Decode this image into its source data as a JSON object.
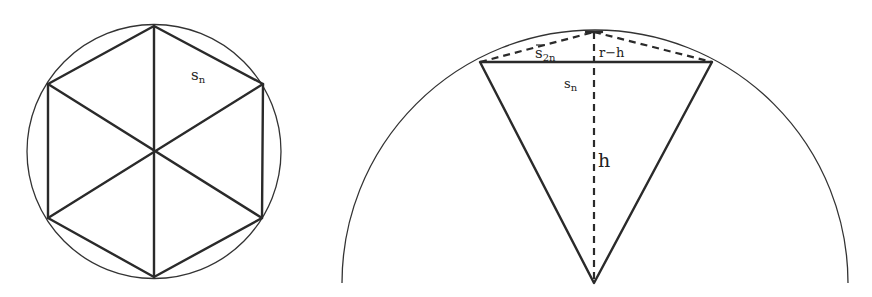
{
  "figure_left": {
    "description": "Regular hexagon inscribed in a circle, divided into six triangles",
    "label_side": "s",
    "label_side_sub": "n"
  },
  "figure_right": {
    "description": "Segment of circle showing chord s_n, half-chord s_2n, height h and r-h",
    "label_s2n": "s",
    "label_s2n_sub": "2n",
    "label_r_minus_h": "r−h",
    "label_sn": "s",
    "label_sn_sub": "n",
    "label_h": "h"
  },
  "colors": {
    "stroke": "#2a2a2a",
    "background": "#ffffff"
  }
}
